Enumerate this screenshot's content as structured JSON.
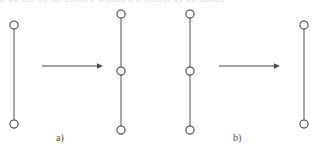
{
  "figure": {
    "cut_text_top": "a wa uul uy un uuiuu a wuunu a u uuulul uy uu uunuu",
    "background_color": "#ffffff",
    "node_stroke_color": "#3c3c42",
    "node_fill_color": "#ffffff",
    "edge_color": "#56565c",
    "arrow_color": "#4a4a50",
    "label_color": "#4a4a50",
    "node_radius": 4.1,
    "panels": [
      {
        "id": "panel-a",
        "label": "a)",
        "label_x": 56,
        "label_y": 141,
        "arrow": {
          "x1": 42,
          "x2": 103,
          "y": 66,
          "direction": "right"
        },
        "graphs": [
          {
            "id": "panel-a-graph-left",
            "role": "before",
            "node_count": 2,
            "cx": 14,
            "nodes_y": [
              25,
              124
            ],
            "edges": [
              [
                0,
                1
              ]
            ]
          },
          {
            "id": "panel-a-graph-right",
            "role": "after",
            "node_count": 3,
            "cx": 121,
            "nodes_y": [
              14,
              71,
              130
            ],
            "edges": [
              [
                0,
                1
              ],
              [
                1,
                2
              ]
            ]
          }
        ]
      },
      {
        "id": "panel-b",
        "label": "b)",
        "label_x": 233,
        "label_y": 141,
        "arrow": {
          "x1": 219,
          "x2": 280,
          "y": 66,
          "direction": "right"
        },
        "graphs": [
          {
            "id": "panel-b-graph-left",
            "role": "before",
            "node_count": 3,
            "cx": 190,
            "nodes_y": [
              14,
              71,
              130
            ],
            "edges": [
              [
                0,
                1
              ],
              [
                1,
                2
              ]
            ]
          },
          {
            "id": "panel-b-graph-right",
            "role": "after",
            "node_count": 2,
            "cx": 304,
            "nodes_y": [
              25,
              124
            ],
            "edges": [
              [
                0,
                1
              ]
            ]
          }
        ]
      }
    ]
  }
}
